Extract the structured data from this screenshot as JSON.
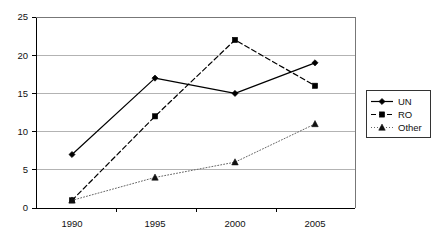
{
  "chart_data": {
    "type": "line",
    "title": "",
    "subtitle": "",
    "xlabel": "",
    "ylabel": "",
    "categories": [
      "1990",
      "1995",
      "2000",
      "2005"
    ],
    "x": [
      1990,
      1995,
      2000,
      2005
    ],
    "series": [
      {
        "name": "UN",
        "values": [
          7,
          17,
          15,
          19
        ],
        "line_style": "solid",
        "marker": "diamond",
        "color": "#000000"
      },
      {
        "name": "RO",
        "values": [
          1,
          12,
          22,
          16
        ],
        "line_style": "dashed",
        "marker": "square",
        "color": "#000000"
      },
      {
        "name": "Other",
        "values": [
          1,
          4,
          6,
          11
        ],
        "line_style": "dotted",
        "marker": "triangle",
        "color": "#666666"
      }
    ],
    "ylim": [
      0,
      25
    ],
    "y_ticks": [
      0,
      5,
      10,
      15,
      20,
      25
    ],
    "y_tick_labels": [
      "0",
      "5",
      "10",
      "15",
      "20",
      "25"
    ],
    "x_tick_labels": [
      "1990",
      "1995",
      "2000",
      "2005"
    ],
    "grid": {
      "horizontal": true,
      "vertical": false,
      "color": "#b3b3b3"
    },
    "legend": {
      "position": "right",
      "entries": [
        "UN",
        "RO",
        "Other"
      ],
      "border": true
    },
    "axis_color": "#000000",
    "background": "#ffffff"
  }
}
